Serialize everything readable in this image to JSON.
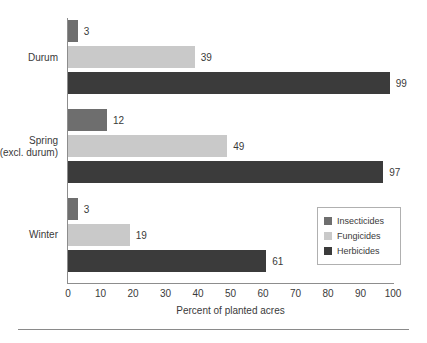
{
  "chart_data": {
    "type": "bar",
    "orientation": "horizontal",
    "title": "",
    "xlabel": "Percent of planted acres",
    "ylabel": "",
    "xlim": [
      0,
      100
    ],
    "xticks": [
      0,
      10,
      20,
      30,
      40,
      50,
      60,
      70,
      80,
      90,
      100
    ],
    "grid": false,
    "legend_position": "bottom-right",
    "categories": [
      "Durum",
      "Spring\n(excl. durum)",
      "Winter"
    ],
    "category_lines": [
      [
        "Durum"
      ],
      [
        "Spring",
        "(excl. durum)"
      ],
      [
        "Winter"
      ]
    ],
    "series": [
      {
        "name": "Insecticides",
        "color": "#6e6e6e",
        "values": [
          3,
          12,
          3
        ]
      },
      {
        "name": "Fungicides",
        "color": "#c9c9c9",
        "values": [
          39,
          49,
          19
        ]
      },
      {
        "name": "Herbicides",
        "color": "#3b3b3b",
        "values": [
          99,
          97,
          61
        ]
      }
    ],
    "value_labels": {
      "Durum": {
        "Insecticides": "3",
        "Fungicides": "39",
        "Herbicides": "99"
      },
      "Spring (excl. durum)": {
        "Insecticides": "12",
        "Fungicides": "49",
        "Herbicides": "97"
      },
      "Winter": {
        "Insecticides": "3",
        "Fungicides": "19",
        "Herbicides": "61"
      }
    }
  },
  "legend": {
    "items": [
      {
        "label": "Insecticides",
        "color": "#6e6e6e"
      },
      {
        "label": "Fungicides",
        "color": "#c9c9c9"
      },
      {
        "label": "Herbicides",
        "color": "#3b3b3b"
      }
    ]
  },
  "axis": {
    "x_title": "Percent of planted acres",
    "ticks": [
      "0",
      "10",
      "20",
      "30",
      "40",
      "50",
      "60",
      "70",
      "80",
      "90",
      "100"
    ]
  },
  "colors": {
    "insecticides": "#6e6e6e",
    "fungicides": "#c9c9c9",
    "herbicides": "#3b3b3b",
    "axis": "#8d8d8d",
    "text": "#3a3a3a",
    "background": "#ffffff"
  }
}
